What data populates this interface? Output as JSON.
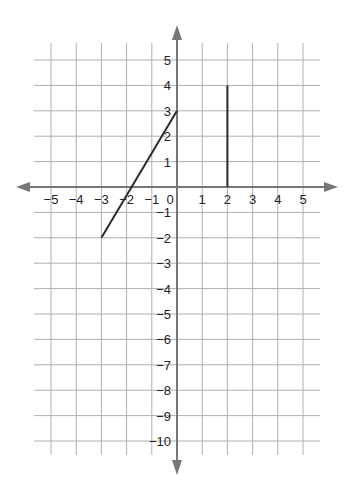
{
  "chart_data": {
    "type": "line",
    "title": "",
    "xlabel": "",
    "ylabel": "",
    "grid": true,
    "xlim": [
      -5,
      5
    ],
    "ylim": [
      -10,
      5
    ],
    "x_ticks": [
      -5,
      -4,
      -3,
      -2,
      -1,
      0,
      1,
      2,
      3,
      4,
      5
    ],
    "y_ticks": [
      5,
      4,
      3,
      2,
      1,
      -1,
      -2,
      -3,
      -4,
      -5,
      -6,
      -7,
      -8,
      -9,
      -10
    ],
    "x_tick_labels": [
      "−5",
      "−4",
      "−3",
      "−2",
      "−1",
      "0",
      "1",
      "2",
      "3",
      "4",
      "5"
    ],
    "y_tick_labels": [
      "5",
      "4",
      "3",
      "2",
      "1",
      "−1",
      "−2",
      "−3",
      "−4",
      "−5",
      "−6",
      "−7",
      "−8",
      "−9",
      "−10"
    ],
    "series": [
      {
        "name": "slanted segment",
        "points": [
          [
            -3,
            -2
          ],
          [
            0,
            3
          ]
        ]
      },
      {
        "name": "vertical segment",
        "points": [
          [
            2,
            0
          ],
          [
            2,
            4
          ]
        ]
      }
    ],
    "axes_arrows": {
      "x": "both",
      "y": "both"
    }
  },
  "colors": {
    "grid": "#b0b0b0",
    "axis": "#777777",
    "segment": "#2a2a2a",
    "label": "#222222"
  }
}
